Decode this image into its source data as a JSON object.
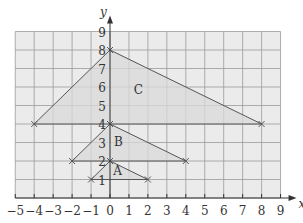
{
  "chart_data": {
    "type": "diagram",
    "title": "",
    "xlabel": "x",
    "ylabel": "y",
    "xlim": [
      -5,
      9
    ],
    "ylim": [
      0,
      9
    ],
    "grid": true,
    "x_ticks": [
      "−5",
      "−4",
      "−3",
      "−2",
      "−1",
      "0",
      "1",
      "2",
      "3",
      "4",
      "5",
      "6",
      "7",
      "8",
      "9"
    ],
    "y_ticks": [
      "1",
      "2",
      "3",
      "4",
      "5",
      "6",
      "7",
      "8",
      "9"
    ],
    "shapes": [
      {
        "label": "A",
        "vertices": [
          [
            -1,
            1
          ],
          [
            0,
            2
          ],
          [
            2,
            1
          ]
        ],
        "label_pos": [
          0.4,
          1.25
        ]
      },
      {
        "label": "B",
        "vertices": [
          [
            -2,
            2
          ],
          [
            0,
            4
          ],
          [
            4,
            2
          ]
        ],
        "label_pos": [
          0.45,
          2.8
        ]
      },
      {
        "label": "C",
        "vertices": [
          [
            -4,
            4
          ],
          [
            0,
            8
          ],
          [
            8,
            4
          ]
        ],
        "label_pos": [
          1.5,
          5.6
        ]
      }
    ]
  },
  "colors": {
    "grid_bg": "#ebebeb",
    "grid_line": "#9a9a9a",
    "shape_fill": "#d9d9d9",
    "line": "#555555",
    "axis": "#333333"
  }
}
